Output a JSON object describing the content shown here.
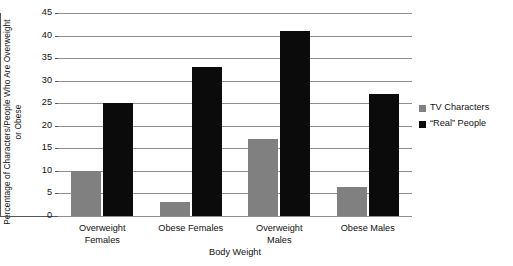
{
  "chart_data": {
    "type": "bar",
    "title": "",
    "xlabel": "Body Weight",
    "ylabel": "Percentage of Characters/People Who Are Overweight or Obese",
    "categories": [
      "Overweight Females",
      "Obese Females",
      "Overweight Males",
      "Obese Males"
    ],
    "category_lines": [
      [
        "Overweight",
        "Females"
      ],
      [
        "Obese Females",
        ""
      ],
      [
        "Overweight",
        "Males"
      ],
      [
        "Obese Males",
        ""
      ]
    ],
    "series": [
      {
        "name": "TV Characters",
        "color": "#808080",
        "values": [
          10,
          3,
          17,
          6.5
        ]
      },
      {
        "name": "“Real” People",
        "color": "#0b0b0b",
        "values": [
          25,
          33,
          41,
          27
        ]
      }
    ],
    "ylim": [
      0,
      45
    ],
    "ytick_values": [
      45,
      40,
      35,
      30,
      25,
      20,
      15,
      10,
      5,
      0
    ],
    "ytick_labels": [
      "45",
      "40",
      "35",
      "30",
      "25",
      "20",
      "15",
      "10",
      "5",
      "0"
    ],
    "grid": true,
    "grid_axis": "y",
    "legend_position": "right",
    "legend": [
      {
        "label": "TV Characters",
        "color": "#808080"
      },
      {
        "label": "“Real” People",
        "color": "#0b0b0b"
      }
    ]
  }
}
